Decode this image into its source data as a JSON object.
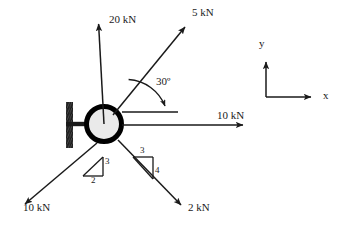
{
  "diagram": {
    "colors": {
      "stroke": "#1a1a1a",
      "ball_fill": "#e9e9e9",
      "ball_ring": "#000000",
      "wall": "#1f1f1f",
      "background": "#ffffff"
    },
    "body": {
      "shape_name": "ball",
      "center_x": 104,
      "center_y": 124,
      "radius": 20,
      "ring_width": 5
    },
    "support": {
      "name": "fixed-wall-support",
      "wall_x": 66,
      "wall_top": 102,
      "wall_bottom": 148,
      "wall_width": 7,
      "stem_y": 124,
      "stem_from_x": 66,
      "stem_to_x": 86
    },
    "forces": [
      {
        "id": "force-20kn-up",
        "label": "20  kN",
        "magnitude": "20",
        "unit": "kN",
        "from_x": 104,
        "from_y": 124,
        "to_x": 98,
        "to_y": 19,
        "label_x": 108,
        "label_y": 18
      },
      {
        "id": "force-5kn-upper-right",
        "label": "5  kN",
        "magnitude": "5",
        "unit": "kN",
        "from_x": 112,
        "from_y": 116,
        "to_x": 189,
        "to_y": 22,
        "label_x": 193,
        "label_y": 11
      },
      {
        "id": "force-10kn-right",
        "label": "10  kN",
        "magnitude": "10",
        "unit": "kN",
        "from_x": 122,
        "from_y": 125,
        "to_x": 248,
        "to_y": 125,
        "label_x": 218,
        "label_y": 115
      },
      {
        "id": "force-10kn-lower-left",
        "label": "10  kN",
        "magnitude": "10",
        "unit": "kN",
        "from_x": 98,
        "from_y": 144,
        "to_x": 20,
        "to_y": 209,
        "label_x": 24,
        "label_y": 206
      },
      {
        "id": "force-2kn-lower-right",
        "label": "2  kN",
        "magnitude": "2",
        "unit": "kN",
        "from_x": 119,
        "from_y": 141,
        "to_x": 185,
        "to_y": 210,
        "label_x": 189,
        "label_y": 205
      }
    ],
    "angle_annotation": {
      "id": "angle-30-degrees",
      "label": "30º",
      "value": "30",
      "unit": "degrees",
      "label_x": 157,
      "label_y": 80,
      "reference_line": {
        "x1": 123,
        "y1": 112,
        "x2": 178,
        "y2": 112
      },
      "arc": {
        "cx": 123,
        "cy": 112,
        "radius": 42
      }
    },
    "slope_triangles": [
      {
        "id": "slope-triangle-left",
        "rise_label": "3",
        "run_label": "2",
        "rise_x": 106,
        "rise_y": 162,
        "run_x": 95,
        "run_y": 182,
        "apex_x": 103,
        "apex_y": 157,
        "corner_x": 103,
        "corner_y": 176,
        "base_x": 82,
        "base_y": 176
      },
      {
        "id": "slope-triangle-right",
        "rise_label": "4",
        "run_label": "3",
        "run_x": 142,
        "run_y": 152,
        "rise_x": 155,
        "rise_y": 173,
        "left_x": 133,
        "left_y": 157,
        "right_x": 153,
        "right_y": 157,
        "bottom_x": 153,
        "bottom_y": 179
      }
    ],
    "axes_indicator": {
      "id": "coordinate-axes",
      "origin_x": 266,
      "origin_y": 97,
      "y_label": "y",
      "x_label": "x",
      "y_tip_x": 266,
      "y_tip_y": 57,
      "x_tip_x": 316,
      "x_tip_y": 97,
      "y_label_x": 260,
      "y_label_y": 43,
      "x_label_x": 325,
      "x_label_y": 92
    }
  }
}
